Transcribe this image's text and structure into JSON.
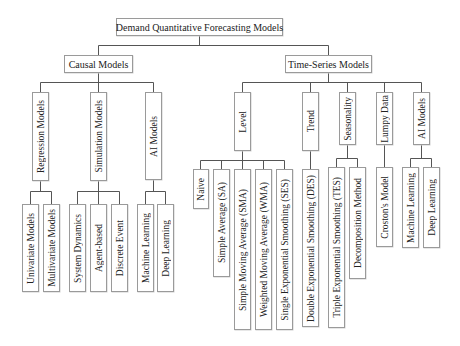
{
  "root": {
    "label": "Demand Quantitative Forecasting Models"
  },
  "causal": {
    "label": "Causal Models",
    "regression": {
      "label": "Regression Models",
      "children": [
        "Univariate Models",
        "Multivariate Models"
      ]
    },
    "simulation": {
      "label": "Simulation Models",
      "children": [
        "System Dynamics",
        "Agent-based",
        "Discrete Event"
      ]
    },
    "ai": {
      "label": "AI Models",
      "children": [
        "Machine Learning",
        "Deep Learning"
      ]
    }
  },
  "timeseries": {
    "label": "Time-Series Models",
    "level": {
      "label": "Level",
      "children": [
        "Naive",
        "Simple Average (SA)",
        "Simple Moving Average (SMA)",
        "Weighted Moving Average (WMA)",
        "Single Exponential Smoothing (SES)"
      ]
    },
    "trend": {
      "label": "Trend",
      "children": [
        "Double Exponential Smoothing (DES)"
      ]
    },
    "seasonality": {
      "label": "Seasonality",
      "children": [
        "Triple Exponential Smoothing (TES)",
        "Decomposition Method"
      ]
    },
    "lumpy": {
      "label": "Lumpy Data",
      "children": [
        "Croston's Model"
      ]
    },
    "ai": {
      "label": "AI Models",
      "children": [
        "Machine Learning",
        "Deep Learning"
      ]
    }
  },
  "colors": {
    "line": "#555555",
    "border": "#9a9a9a",
    "text": "#222222"
  }
}
